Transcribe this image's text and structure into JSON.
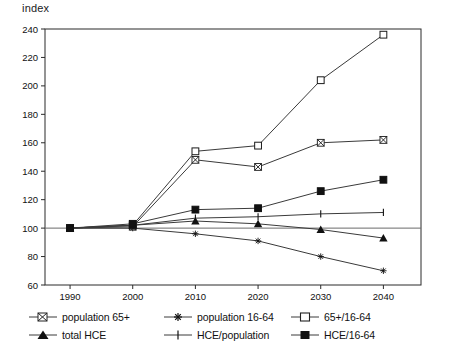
{
  "chart_data": {
    "type": "line",
    "title": "",
    "ylabel": "index",
    "xlabel": "",
    "x": [
      1990,
      2000,
      2010,
      2020,
      2030,
      2040
    ],
    "xtick_labels": [
      "1990",
      "2000",
      "2010",
      "2020",
      "2030",
      "2040"
    ],
    "ytick_labels": [
      "60",
      "80",
      "100",
      "120",
      "140",
      "160",
      "180",
      "200",
      "220",
      "240"
    ],
    "yticks": [
      60,
      80,
      100,
      120,
      140,
      160,
      180,
      200,
      220,
      240
    ],
    "ylim": [
      60,
      240
    ],
    "xlim": [
      1986,
      2046
    ],
    "grid": false,
    "reference_line": 100,
    "legend_position": "below",
    "series": [
      {
        "name": "population 65+",
        "marker": "bowtie",
        "values": [
          100,
          101,
          148,
          143,
          160,
          162
        ]
      },
      {
        "name": "population 16-64",
        "marker": "asterisk",
        "values": [
          100,
          100,
          96,
          91,
          80,
          70
        ]
      },
      {
        "name": "65+/16-64",
        "marker": "open-square",
        "values": [
          100,
          102,
          154,
          158,
          204,
          236
        ]
      },
      {
        "name": "total HCE",
        "marker": "filled-triangle",
        "values": [
          100,
          102,
          105,
          103,
          99,
          93
        ]
      },
      {
        "name": "HCE/population",
        "marker": "plus",
        "values": [
          100,
          102,
          107,
          108,
          110,
          111
        ]
      },
      {
        "name": "HCE/16-64",
        "marker": "filled-square",
        "values": [
          100,
          103,
          113,
          114,
          126,
          134
        ]
      }
    ],
    "colors": {
      "line": "#3a3a3a",
      "axis": "#2b2b2b",
      "text": "#111111",
      "background": "#ffffff"
    }
  }
}
